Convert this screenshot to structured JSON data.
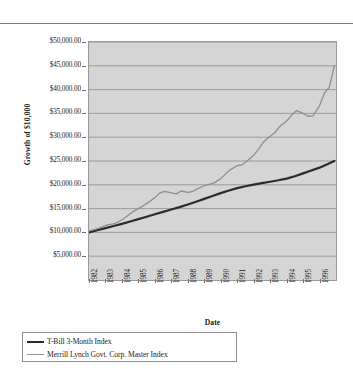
{
  "chart_data": {
    "type": "line",
    "title": "",
    "xlabel": "Date",
    "ylabel": "Growth of $10,000",
    "grid": "horizontal",
    "legend_position": "bottom-left",
    "ylim": [
      0,
      50000
    ],
    "ytick_values": [
      50000,
      45000,
      40000,
      35000,
      30000,
      25000,
      20000,
      15000,
      10000,
      5000
    ],
    "ytick_labels": [
      "$50,000.00",
      "$45,000.00",
      "$40,000.00",
      "$35,000.00",
      "$30,000.00",
      "$25,000.00",
      "$20,000.00",
      "$15,000.00",
      "$10,000.00",
      "$5,000.00"
    ],
    "categories": [
      "1982",
      "1983",
      "1984",
      "1985",
      "1986",
      "1987",
      "1988",
      "1989",
      "1990",
      "1991",
      "1992",
      "1993",
      "1994",
      "1995",
      "1996"
    ],
    "xlim": [
      1982,
      1997
    ],
    "series": [
      {
        "name": "T-Bill 3-Month Index",
        "color": "#2b2b2b",
        "width": 2.2,
        "x": [
          1982.0,
          1982.5,
          1983.0,
          1983.5,
          1984.0,
          1984.5,
          1985.0,
          1985.5,
          1986.0,
          1986.5,
          1987.0,
          1987.5,
          1988.0,
          1988.5,
          1989.0,
          1989.5,
          1990.0,
          1990.5,
          1991.0,
          1991.5,
          1992.0,
          1992.5,
          1993.0,
          1993.5,
          1994.0,
          1994.5,
          1995.0,
          1995.5,
          1996.0,
          1996.5,
          1996.9
        ],
        "values": [
          10000,
          10450,
          10900,
          11350,
          11800,
          12300,
          12800,
          13300,
          13800,
          14300,
          14800,
          15300,
          15850,
          16450,
          17050,
          17650,
          18250,
          18800,
          19300,
          19700,
          20050,
          20350,
          20650,
          20950,
          21300,
          21800,
          22400,
          23000,
          23600,
          24350,
          25000
        ]
      },
      {
        "name": "Merrill Lynch Govt. Corp. Master Index",
        "color": "#8f8f8f",
        "width": 1.3,
        "x": [
          1982.0,
          1982.3,
          1982.6,
          1983.0,
          1983.3,
          1983.6,
          1984.0,
          1984.3,
          1984.6,
          1985.0,
          1985.3,
          1985.6,
          1986.0,
          1986.3,
          1986.6,
          1987.0,
          1987.3,
          1987.6,
          1988.0,
          1988.3,
          1988.6,
          1989.0,
          1989.3,
          1989.6,
          1990.0,
          1990.3,
          1990.6,
          1991.0,
          1991.3,
          1991.6,
          1992.0,
          1992.3,
          1992.6,
          1993.0,
          1993.3,
          1993.6,
          1994.0,
          1994.3,
          1994.6,
          1995.0,
          1995.3,
          1995.6,
          1996.0,
          1996.3,
          1996.6,
          1996.9
        ],
        "values": [
          10300,
          10600,
          10900,
          11450,
          11700,
          11900,
          12600,
          13400,
          14200,
          15000,
          15600,
          16300,
          17300,
          18300,
          18600,
          18300,
          18100,
          18700,
          18400,
          18600,
          19200,
          19800,
          20100,
          20400,
          21300,
          22300,
          23200,
          24000,
          24200,
          25000,
          26200,
          27500,
          29000,
          30200,
          31000,
          32300,
          33400,
          34600,
          35600,
          35000,
          34400,
          34500,
          36600,
          39300,
          40500,
          45000
        ]
      }
    ]
  },
  "axis": {
    "y_title": "Growth of $10,000",
    "x_title": "Date"
  },
  "legend": {
    "entries": [
      {
        "label": "T-Bill 3-Month Index",
        "swatch": "tbill"
      },
      {
        "label": "Merrill Lynch Govt. Corp. Master Index",
        "swatch": "merrill"
      }
    ]
  }
}
